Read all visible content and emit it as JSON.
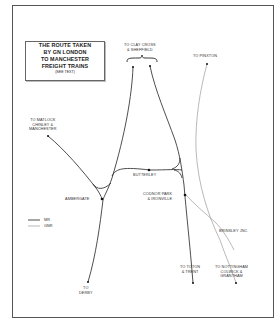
{
  "title_box": {
    "lines": [
      "THE ROUTE TAKEN",
      "BY GN LONDON",
      "TO MANCHESTER",
      "FREIGHT TRAINS"
    ],
    "note": "(SEE TEXT)"
  },
  "labels": {
    "clay_cross": [
      "TO CLAY CROSS",
      "& SHEFFIELD"
    ],
    "pinxton": [
      "TO PINXTON"
    ],
    "matlock": [
      "TO MATLOCK",
      "CHINLEY &",
      "MANCHESTER"
    ],
    "butterley": [
      "BUTTERLEY"
    ],
    "ambergate": [
      "AMBERGATE"
    ],
    "codnor_park": [
      "CODNOR PARK",
      "& IRONVILLE"
    ],
    "brinsley": [
      "BRINSLEY JNC"
    ],
    "derby": [
      "TO",
      "DERBY"
    ],
    "toton": [
      "TO TOTON",
      "& TRENT"
    ],
    "nottingham": [
      "TO NOTTINGHAM",
      "COLWICK &",
      "GRANTHAM"
    ]
  },
  "legend": {
    "items": [
      {
        "label": "MR",
        "style": "solid",
        "color": "#222222"
      },
      {
        "label": "GNR",
        "style": "thin",
        "color": "#888888"
      }
    ]
  },
  "colors": {
    "mr_line": "#222222",
    "gnr_line": "#8a8a8a",
    "frame": "#555555"
  }
}
